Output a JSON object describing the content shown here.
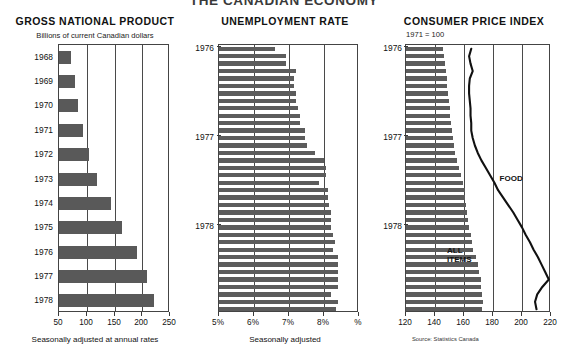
{
  "title": "THE CANADIAN ECONOMY",
  "source_note": "Source: Statistics Canada",
  "panels": {
    "gnp": {
      "title": "GROSS NATIONAL PRODUCT",
      "subtitle": "Billions of current Canadian dollars",
      "axis_caption": "Seasonally adjusted at annual rates"
    },
    "unemployment": {
      "title": "UNEMPLOYMENT RATE",
      "axis_caption": "Seasonally adjusted"
    },
    "cpi": {
      "title": "CONSUMER PRICE INDEX",
      "subtitle": "1971  =  100",
      "label_food": "FOOD",
      "label_all_items_line1": "ALL",
      "label_all_items_line2": "ITEMS"
    }
  },
  "chart_data": [
    {
      "id": "gnp",
      "type": "bar",
      "orientation": "horizontal",
      "title": "GROSS NATIONAL PRODUCT",
      "subtitle": "Billions of current Canadian dollars",
      "xlabel": "Seasonally adjusted at annual rates",
      "ylabel": "",
      "xlim": [
        50,
        250
      ],
      "xticks": [
        50,
        100,
        150,
        200,
        250
      ],
      "xtick_labels": [
        "50",
        "100",
        "150",
        "200",
        "250"
      ],
      "grid": true,
      "categories": [
        "1968",
        "1969",
        "1970",
        "1971",
        "1972",
        "1973",
        "1974",
        "1975",
        "1976",
        "1977",
        "1978"
      ],
      "values": [
        71,
        78,
        85,
        94,
        104,
        119,
        144,
        163,
        190,
        209,
        222
      ]
    },
    {
      "id": "unemployment",
      "type": "bar",
      "orientation": "horizontal",
      "title": "UNEMPLOYMENT RATE",
      "subtitle": "",
      "xlabel": "Seasonally adjusted",
      "ylabel": "",
      "xlim": [
        5,
        9
      ],
      "xticks": [
        5,
        6,
        7,
        8,
        9
      ],
      "xtick_labels": [
        "5%",
        "6%",
        "7%",
        "8%",
        "%"
      ],
      "grid": true,
      "year_marks": [
        {
          "label": "1976",
          "index": 0
        },
        {
          "label": "1977",
          "index": 12
        },
        {
          "label": "1978",
          "index": 24
        }
      ],
      "categories": [
        "1976-01",
        "1976-02",
        "1976-03",
        "1976-04",
        "1976-05",
        "1976-06",
        "1976-07",
        "1976-08",
        "1976-09",
        "1976-10",
        "1976-11",
        "1976-12",
        "1977-01",
        "1977-02",
        "1977-03",
        "1977-04",
        "1977-05",
        "1977-06",
        "1977-07",
        "1977-08",
        "1977-09",
        "1977-10",
        "1977-11",
        "1977-12",
        "1978-01",
        "1978-02",
        "1978-03",
        "1978-04",
        "1978-05",
        "1978-06",
        "1978-07",
        "1978-08",
        "1978-09",
        "1978-10",
        "1978-11",
        "1978-12"
      ],
      "values": [
        6.6,
        6.9,
        6.9,
        7.2,
        7.15,
        7.15,
        7.2,
        7.2,
        7.25,
        7.3,
        7.3,
        7.45,
        7.45,
        7.5,
        7.75,
        8.0,
        8.05,
        8.05,
        7.85,
        8.1,
        8.1,
        8.15,
        8.2,
        8.2,
        8.2,
        8.25,
        8.3,
        8.25,
        8.4,
        8.4,
        8.4,
        8.4,
        8.4,
        8.2,
        8.4,
        8.35
      ]
    },
    {
      "id": "cpi",
      "type": "bar+line",
      "orientation": "horizontal",
      "title": "CONSUMER PRICE INDEX",
      "subtitle": "1971  =  100",
      "xlabel": "",
      "ylabel": "",
      "xlim": [
        120,
        220
      ],
      "xticks": [
        120,
        140,
        160,
        180,
        200,
        220
      ],
      "xtick_labels": [
        "120",
        "140",
        "160",
        "180",
        "200",
        "220"
      ],
      "grid": true,
      "year_marks": [
        {
          "label": "1976",
          "index": 0
        },
        {
          "label": "1977",
          "index": 12
        },
        {
          "label": "1978",
          "index": 24
        }
      ],
      "series": [
        {
          "name": "ALL ITEMS",
          "render": "bars",
          "values": [
            145.5,
            146.5,
            147.0,
            147.5,
            148.0,
            148.5,
            149.0,
            149.5,
            150.0,
            150.5,
            151.0,
            151.5,
            152.5,
            153.0,
            154.0,
            155.0,
            156.5,
            158.0,
            159.5,
            160.5,
            161.0,
            161.5,
            162.0,
            162.5,
            163.5,
            164.5,
            165.5,
            166.5,
            168.0,
            169.5,
            170.5,
            171.5,
            172.0,
            172.5,
            173.0,
            172.5
          ]
        },
        {
          "name": "FOOD",
          "render": "line",
          "values": [
            165.0,
            163.5,
            164.5,
            166.0,
            164.0,
            163.5,
            163.5,
            164.0,
            164.5,
            164.5,
            165.0,
            165.0,
            166.0,
            167.5,
            169.5,
            172.0,
            175.0,
            178.0,
            181.0,
            183.5,
            187.0,
            190.5,
            194.0,
            197.0,
            200.0,
            202.5,
            205.5,
            208.0,
            211.0,
            213.5,
            216.0,
            218.5,
            214.0,
            210.5,
            209.0,
            210.0
          ]
        }
      ]
    }
  ]
}
